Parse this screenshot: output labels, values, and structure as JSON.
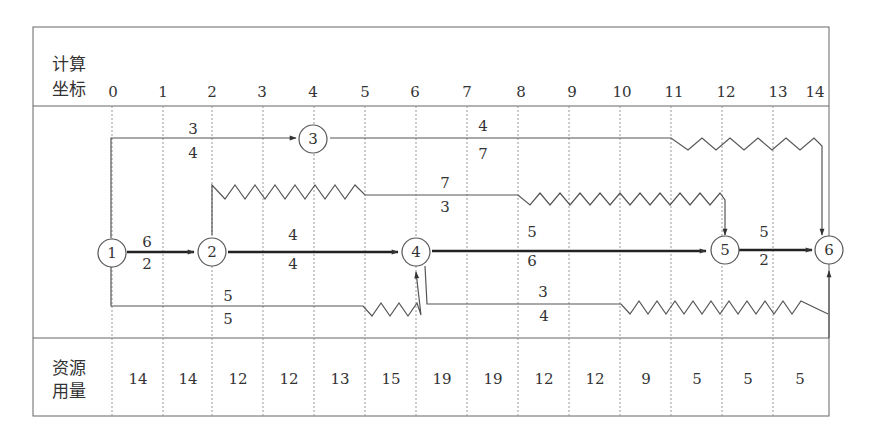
{
  "header": {
    "label_line1": "计算",
    "label_line2": "坐标",
    "ticks": [
      "0",
      "1",
      "2",
      "3",
      "4",
      "5",
      "6",
      "7",
      "8",
      "9",
      "10",
      "11",
      "12",
      "13",
      "14"
    ]
  },
  "footer": {
    "label_line1": "资源",
    "label_line2": "用量",
    "values": [
      "14",
      "14",
      "12",
      "12",
      "13",
      "15",
      "19",
      "19",
      "12",
      "12",
      "9",
      "5",
      "5",
      "5"
    ]
  },
  "nodes": [
    {
      "id": "1",
      "label": "1",
      "t": 0
    },
    {
      "id": "2",
      "label": "2",
      "t": 2
    },
    {
      "id": "3",
      "label": "3",
      "t": 4
    },
    {
      "id": "4",
      "label": "4",
      "t": 6
    },
    {
      "id": "5",
      "label": "5",
      "t": 12
    },
    {
      "id": "6",
      "label": "6",
      "t": 14
    }
  ],
  "activities": [
    {
      "from": "1",
      "to": "2",
      "resource": "6",
      "duration": "2",
      "critical": true
    },
    {
      "from": "1",
      "to": "3",
      "resource": "3",
      "duration": "4",
      "critical": false
    },
    {
      "from": "1",
      "to": "4",
      "resource": "5",
      "duration": "5",
      "critical": false,
      "free_float": 1
    },
    {
      "from": "2",
      "to": "4",
      "resource": "4",
      "duration": "4",
      "critical": true
    },
    {
      "from": "2",
      "to": "5",
      "resource": "7",
      "duration": "3",
      "critical": false,
      "note": "starts with wavy float 2–5, solid 5–8, wavy 8–12"
    },
    {
      "from": "3",
      "to": "6",
      "resource": "4",
      "duration": "7",
      "critical": false,
      "free_float": 3
    },
    {
      "from": "4",
      "to": "5",
      "resource": "5",
      "duration": "6",
      "critical": true
    },
    {
      "from": "4",
      "to": "6",
      "resource": "3",
      "duration": "4",
      "critical": false,
      "free_float": 4
    },
    {
      "from": "5",
      "to": "6",
      "resource": "5",
      "duration": "2",
      "critical": true
    }
  ],
  "colors": {
    "line": "#555555",
    "critical": "#222222",
    "grid": "#999999",
    "border": "#666666"
  }
}
